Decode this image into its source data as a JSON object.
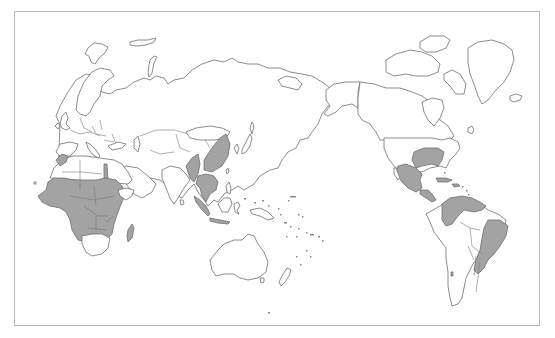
{
  "map": {
    "projection": "Pacific-centered world outline map",
    "style": {
      "land_fill": "#ffffff",
      "outline_color": "#6e6e6e",
      "highlight_fill": "#a3a3a3",
      "frame_color": "#b9b9b9",
      "background": "#ffffff"
    },
    "highlighted_regions": [
      "West Africa",
      "Central Africa",
      "East Africa",
      "Southern-central Africa",
      "Madagascar",
      "Nile valley (Sudan/Egypt)",
      "Morocco",
      "Southern China",
      "Southeast Asia",
      "Myanmar / Northeast India",
      "Indonesia (Sumatra/Java)",
      "Southeastern United States",
      "Mexico",
      "Central America",
      "Caribbean",
      "Colombia / Venezuela / Guianas",
      "Eastern Brazil",
      "Uruguay"
    ],
    "unhighlighted_regions": [
      "Europe",
      "Russia",
      "Middle East",
      "India",
      "Australia",
      "New Zealand",
      "Canada",
      "Greenland",
      "Alaska",
      "Northern United States",
      "Western South America",
      "Argentina",
      "Chile"
    ]
  }
}
